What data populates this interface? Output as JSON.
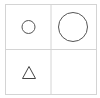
{
  "grid": {
    "rows": 2,
    "cols": 2,
    "line_color": "#d4d4d4",
    "shape_color": "#555555",
    "cells": [
      {
        "row": 0,
        "col": 0,
        "shape": "circle",
        "size": "small"
      },
      {
        "row": 0,
        "col": 1,
        "shape": "circle",
        "size": "large"
      },
      {
        "row": 1,
        "col": 0,
        "shape": "triangle",
        "size": "small"
      },
      {
        "row": 1,
        "col": 1,
        "shape": "empty",
        "size": ""
      }
    ]
  }
}
